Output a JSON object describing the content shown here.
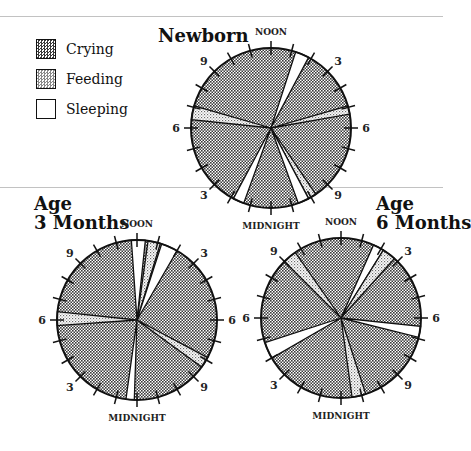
{
  "legend": [
    {
      "label": "Crying",
      "category": "crying"
    },
    {
      "label": "Feeding",
      "category": "feeding"
    },
    {
      "label": "Sleeping",
      "category": "sleeping"
    }
  ],
  "colors": {
    "crying": "#5a5a5a",
    "feeding": "#cfcfcf",
    "sleeping": "#ffffff",
    "outline": "#111111"
  },
  "chart_data": [
    {
      "type": "pie",
      "title": "Newborn",
      "title_lines": [
        "Newborn"
      ],
      "clock": "24-hour, NOON at top, clockwise",
      "hour_labels": [
        "NOON",
        "3",
        "6",
        "9",
        "MIDNIGHT",
        "3",
        "6",
        "9"
      ],
      "default_category": "crying",
      "segments_hours_from_noon": [
        {
          "category": "sleeping",
          "start": 1.2,
          "end": 1.87
        },
        {
          "category": "feeding",
          "start": 4.93,
          "end": 5.33
        },
        {
          "category": "feeding",
          "start": 9.73,
          "end": 10.13
        },
        {
          "category": "sleeping",
          "start": 10.13,
          "end": 10.67
        },
        {
          "category": "sleeping",
          "start": 13.33,
          "end": 13.87
        },
        {
          "category": "feeding",
          "start": 18.4,
          "end": 19.07
        }
      ]
    },
    {
      "type": "pie",
      "title": "Age 3 Months",
      "title_lines": [
        "Age",
        "3 Months"
      ],
      "clock": "24-hour, NOON at top, clockwise",
      "hour_labels": [
        "NOON",
        "3",
        "6",
        "9",
        "MIDNIGHT",
        "3",
        "6",
        "9"
      ],
      "default_category": "crying",
      "segments_hours_from_noon": [
        {
          "category": "sleeping",
          "start": 23.73,
          "end": 0.4
        },
        {
          "category": "feeding",
          "start": 0.53,
          "end": 1.13
        },
        {
          "category": "sleeping",
          "start": 1.2,
          "end": 2.0
        },
        {
          "category": "feeding",
          "start": 7.87,
          "end": 8.4
        },
        {
          "category": "sleeping",
          "start": 12.13,
          "end": 12.53
        },
        {
          "category": "feeding",
          "start": 17.73,
          "end": 18.4
        }
      ]
    },
    {
      "type": "pie",
      "title": "Age 6 Months",
      "title_lines": [
        "Age",
        "6 Months"
      ],
      "clock": "24-hour, NOON at top, clockwise",
      "hour_labels": [
        "NOON",
        "3",
        "6",
        "9",
        "MIDNIGHT",
        "3",
        "6",
        "9"
      ],
      "default_category": "crying",
      "segments_hours_from_noon": [
        {
          "category": "feeding",
          "start": 21.0,
          "end": 21.67
        },
        {
          "category": "sleeping",
          "start": 1.6,
          "end": 2.13
        },
        {
          "category": "feeding",
          "start": 2.13,
          "end": 2.8
        },
        {
          "category": "sleeping",
          "start": 6.4,
          "end": 6.93
        },
        {
          "category": "feeding",
          "start": 10.8,
          "end": 11.47
        },
        {
          "category": "sleeping",
          "start": 16.0,
          "end": 16.8
        }
      ]
    }
  ]
}
